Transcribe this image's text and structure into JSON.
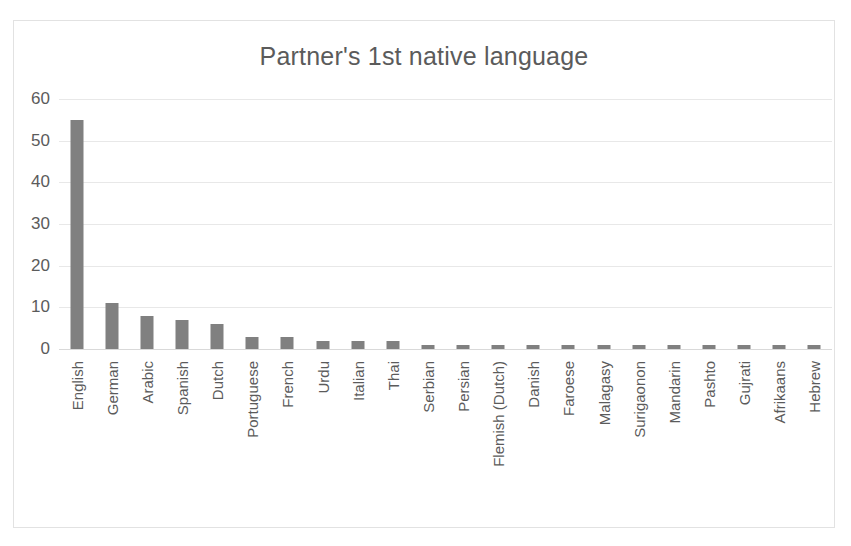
{
  "chart_data": {
    "type": "bar",
    "title": "Partner's 1st native language",
    "xlabel": "",
    "ylabel": "",
    "ylim": [
      0,
      60
    ],
    "yticks": [
      60,
      50,
      40,
      30,
      20,
      10,
      0
    ],
    "grid": true,
    "legend": false,
    "orientation": "vertical",
    "bar_color": "#808080",
    "categories": [
      "English",
      "German",
      "Arabic",
      "Spanish",
      "Dutch",
      "Portuguese",
      "French",
      "Urdu",
      "Italian",
      "Thai",
      "Serbian",
      "Persian",
      "Flemish (Dutch)",
      "Danish",
      "Faroese",
      "Malagasy",
      "Surigaonon",
      "Mandarin",
      "Pashto",
      "Gujrati",
      "Afrikaans",
      "Hebrew"
    ],
    "values": [
      55,
      11,
      8,
      7,
      6,
      3,
      3,
      2,
      2,
      2,
      1,
      1,
      1,
      1,
      1,
      1,
      1,
      1,
      1,
      1,
      1,
      1
    ]
  },
  "style": {
    "text_color": "#5b5b5b",
    "gridline_color": "#e8e8e8",
    "border_color": "#e2e2e2",
    "background": "#ffffff"
  }
}
